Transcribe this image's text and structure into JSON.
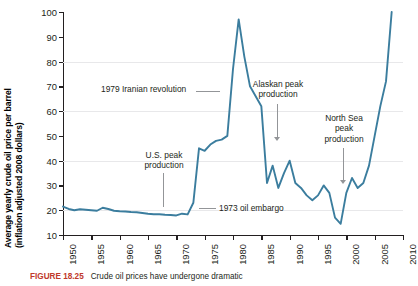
{
  "chart_data": {
    "type": "line",
    "title": "",
    "xlabel": "",
    "ylabel": "Average yearly crude oil price per barrel (inflation adjusted 2008 dollars)",
    "ylabel_line1": "Average yearly crude oil price per barrel",
    "ylabel_line2": "(inflation adjusted 2008 dollars)",
    "xlim": [
      1950,
      2010
    ],
    "ylim": [
      10,
      100
    ],
    "ytick_labels": [
      "100",
      "90",
      "80",
      "70",
      "60",
      "50",
      "40",
      "30",
      "20",
      "10"
    ],
    "ytick_values": [
      100,
      90,
      80,
      70,
      60,
      50,
      40,
      30,
      20,
      10
    ],
    "xtick_labels": [
      "1950",
      "1955",
      "1960",
      "1965",
      "1970",
      "1975",
      "1980",
      "1985",
      "1990",
      "1995",
      "2000",
      "2005",
      "2010"
    ],
    "xtick_values": [
      1950,
      1955,
      1960,
      1965,
      1970,
      1975,
      1980,
      1985,
      1990,
      1995,
      2000,
      2005,
      2010
    ],
    "gridlines_y": [
      20,
      40,
      60,
      80
    ],
    "grid": true,
    "legend": "none",
    "series": [
      {
        "name": "Average yearly crude oil price per barrel",
        "color": "#3b7d9e",
        "x": [
          1950,
          1951,
          1952,
          1953,
          1954,
          1955,
          1956,
          1957,
          1958,
          1959,
          1960,
          1961,
          1962,
          1963,
          1964,
          1965,
          1966,
          1967,
          1968,
          1969,
          1970,
          1971,
          1972,
          1973,
          1974,
          1975,
          1976,
          1977,
          1978,
          1979,
          1980,
          1981,
          1982,
          1983,
          1984,
          1985,
          1986,
          1987,
          1988,
          1989,
          1990,
          1991,
          1992,
          1993,
          1994,
          1995,
          1996,
          1997,
          1998,
          1999,
          2000,
          2001,
          2002,
          2003,
          2004,
          2005,
          2006,
          2007,
          2008
        ],
        "values": [
          21.5,
          20.5,
          20.0,
          20.4,
          20.2,
          20.0,
          19.8,
          21.0,
          20.5,
          19.8,
          19.6,
          19.5,
          19.3,
          19.2,
          18.9,
          18.6,
          18.4,
          18.4,
          18.2,
          18.1,
          17.9,
          18.6,
          18.3,
          23.0,
          45.0,
          44.0,
          46.5,
          48.0,
          48.5,
          50.0,
          77.0,
          97.0,
          82.0,
          70.0,
          66.0,
          62.0,
          31.0,
          38.0,
          29.0,
          35.0,
          40.0,
          31.0,
          29.0,
          26.0,
          24.0,
          26.0,
          30.0,
          27.0,
          17.0,
          14.5,
          27.0,
          33.0,
          29.0,
          31.0,
          38.0,
          50.0,
          62.0,
          72.0,
          100.0
        ]
      }
    ],
    "annotations": [
      {
        "id": "iran",
        "text": "1979 Iranian revolution",
        "leader": "horizontal-right"
      },
      {
        "id": "us",
        "text": "U.S. peak\nproduction",
        "leader": "vertical-down"
      },
      {
        "id": "embargo",
        "text": "1973 oil embargo",
        "leader": "horizontal-left"
      },
      {
        "id": "alaska",
        "text": "Alaskan peak\nproduction",
        "leader": "vertical-down-arrow"
      },
      {
        "id": "northsea",
        "text": "North Sea\npeak\nproduction",
        "leader": "vertical-down-arrow"
      }
    ]
  },
  "caption": {
    "number": "FIGURE 18.25",
    "text": "Crude oil prices have undergone dramatic"
  },
  "colors": {
    "series": "#3b7d9e",
    "axis": "#231f20",
    "gridline": "#e8e8ea",
    "leader": "#939598",
    "caption_number": "#c0392b"
  }
}
